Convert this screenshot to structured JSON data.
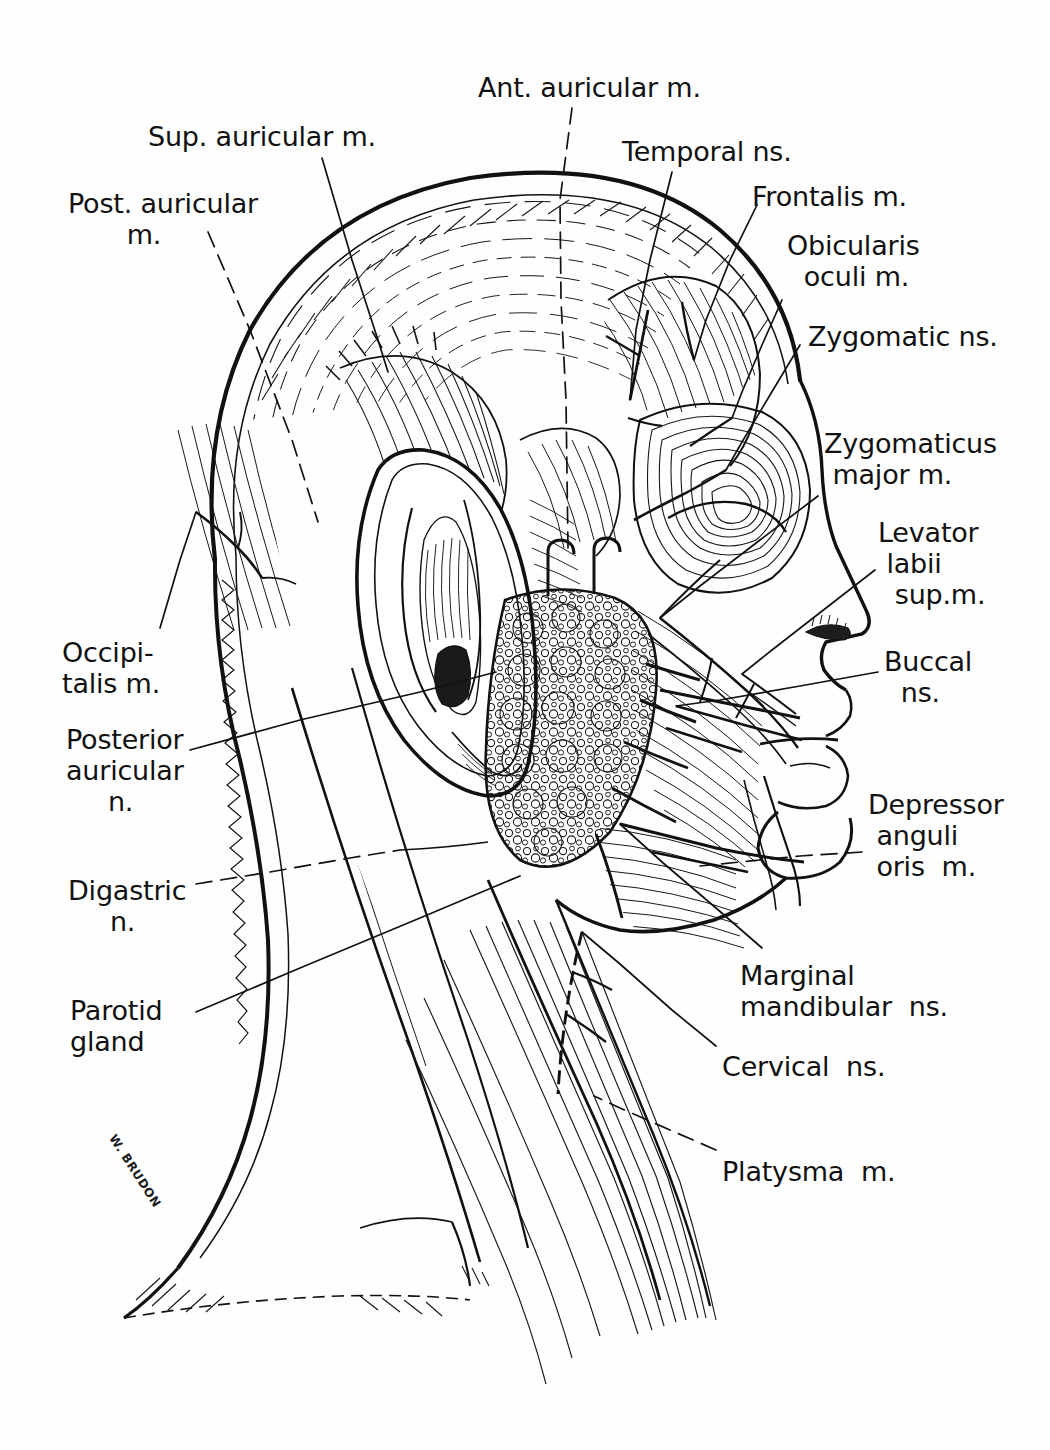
{
  "figure": {
    "artist_signature": "W. BRUDON",
    "ink_color": "#111111",
    "paper_color": "#fefefe"
  },
  "labels": [
    {
      "id": "ant-auricular-m",
      "text": "Ant. auricular m.",
      "x": 478,
      "y": 72,
      "align": "left"
    },
    {
      "id": "sup-auricular-m",
      "text": "Sup. auricular m.",
      "x": 148,
      "y": 121,
      "align": "left"
    },
    {
      "id": "temporal-ns",
      "text": "Temporal ns.",
      "x": 622,
      "y": 136,
      "align": "left"
    },
    {
      "id": "post-auricular-m",
      "text": "Post. auricular\n       m.",
      "x": 68,
      "y": 188,
      "align": "left"
    },
    {
      "id": "frontalis-m",
      "text": "Frontalis m.",
      "x": 752,
      "y": 181,
      "align": "left"
    },
    {
      "id": "obicularis-oculi-m",
      "text": "Obicularis\n  oculi m.",
      "x": 787,
      "y": 230,
      "align": "left"
    },
    {
      "id": "zygomatic-ns",
      "text": "Zygomatic ns.",
      "x": 808,
      "y": 321,
      "align": "left"
    },
    {
      "id": "zygomaticus-major-m",
      "text": "Zygomaticus\n major m.",
      "x": 824,
      "y": 428,
      "align": "left"
    },
    {
      "id": "levator-labii-sup-m",
      "text": "Levator\n labii\n  sup.m.",
      "x": 878,
      "y": 517,
      "align": "left"
    },
    {
      "id": "occipitalis-m",
      "text": "Occipi-\ntalis m.",
      "x": 62,
      "y": 637,
      "align": "left"
    },
    {
      "id": "buccal-ns",
      "text": "Buccal\n  ns.",
      "x": 884,
      "y": 646,
      "align": "left"
    },
    {
      "id": "posterior-auricular-n",
      "text": "Posterior\nauricular\n     n.",
      "x": 66,
      "y": 724,
      "align": "left"
    },
    {
      "id": "depressor-anguli-oris-m",
      "text": "Depressor\n anguli\n oris  m.",
      "x": 868,
      "y": 789,
      "align": "left"
    },
    {
      "id": "digastric-n",
      "text": "Digastric\n     n.",
      "x": 68,
      "y": 875,
      "align": "left"
    },
    {
      "id": "marginal-mandibular-ns",
      "text": "Marginal\nmandibular  ns.",
      "x": 740,
      "y": 960,
      "align": "left"
    },
    {
      "id": "parotid-gland",
      "text": "Parotid\ngland",
      "x": 70,
      "y": 995,
      "align": "left"
    },
    {
      "id": "cervical-ns",
      "text": "Cervical  ns.",
      "x": 722,
      "y": 1051,
      "align": "left"
    },
    {
      "id": "platysma-m",
      "text": "Platysma  m.",
      "x": 722,
      "y": 1156,
      "align": "left"
    }
  ],
  "leader_lines": [
    {
      "id": "leader-ant-auricular-m",
      "label": "ant-auricular-m",
      "dashed": true,
      "path": "M 572,108 L 560,200 L 561,300 L 566,400 L 568,548"
    },
    {
      "id": "leader-sup-auricular-m",
      "label": "sup-auricular-m",
      "dashed": false,
      "path": "M 322,158 L 352,260 L 378,340 L 388,372"
    },
    {
      "id": "leader-temporal-ns",
      "label": "temporal-ns",
      "dashed": false,
      "path": "M 672,172 L 650,260 L 636,330 L 630,400"
    },
    {
      "id": "leader-post-auricular-m",
      "label": "post-auricular-m",
      "dashed": true,
      "path": "M 208,232 L 250,330 L 292,440 L 318,522"
    },
    {
      "id": "leader-frontalis-m",
      "label": "frontalis-m",
      "dashed": false,
      "path": "M 757,205 L 730,260 L 706,320 L 694,360"
    },
    {
      "id": "leader-obicularis-oculi-m",
      "label": "obicularis-oculi-m",
      "dashed": false,
      "path": "M 782,300 L 762,345 L 742,392 L 732,418"
    },
    {
      "id": "leader-zygomatic-ns",
      "label": "zygomatic-ns",
      "dashed": false,
      "path": "M 800,345 L 770,395 L 742,442 L 726,470"
    },
    {
      "id": "leader-zygomaticus-major-m",
      "label": "zygomaticus-major-m",
      "dashed": false,
      "path": "M 818,496 L 760,540 L 700,586 L 660,618"
    },
    {
      "id": "leader-levator-labii-sup-m",
      "label": "levator-labii-sup-m",
      "dashed": false,
      "path": "M 875,570 L 826,608 L 772,650 L 742,674"
    },
    {
      "id": "leader-occipitalis-m",
      "label": "occipitalis-m",
      "dashed": false,
      "path": "M 160,628 L 180,560 L 196,512"
    },
    {
      "id": "leader-buccal-ns",
      "label": "buccal-ns",
      "dashed": false,
      "path": "M 878,672 L 800,686 L 720,700 L 676,706"
    },
    {
      "id": "leader-posterior-auricular-n",
      "label": "posterior-auricular-n",
      "dashed": false,
      "path": "M 190,750 L 300,720 L 420,692 L 496,672"
    },
    {
      "id": "leader-depressor-anguli-oris-m",
      "label": "depressor-anguli-oris-m",
      "dashed": true,
      "path": "M 862,852 L 800,856 L 740,862 L 700,866"
    },
    {
      "id": "leader-digastric-n",
      "label": "digastric-n",
      "dashed": true,
      "path": "M 196,884 L 270,872 L 350,858 L 400,850"
    },
    {
      "id": "leader-marginal-mandibular-ns",
      "label": "marginal-mandibular-ns",
      "dashed": false,
      "path": "M 762,948 L 716,908 L 662,862 L 620,824"
    },
    {
      "id": "leader-parotid-gland",
      "label": "parotid-gland",
      "dashed": false,
      "path": "M 196,1012 L 300,968 L 420,918 L 520,876"
    },
    {
      "id": "leader-cervical-ns",
      "label": "cervical-ns",
      "dashed": false,
      "path": "M 716,1046 L 672,1010 L 620,964 L 582,932"
    },
    {
      "id": "leader-platysma-m",
      "label": "platysma-m",
      "dashed": true,
      "path": "M 716,1150 L 670,1130 L 620,1108 L 594,1096"
    }
  ],
  "anatomy_regions": [
    {
      "id": "cranium-scalp",
      "name": "Scalp / cranial vault with galea aponeurotica"
    },
    {
      "id": "occipitalis-muscle",
      "name": "Occipitalis muscle"
    },
    {
      "id": "auricle",
      "name": "External ear (auricle)"
    },
    {
      "id": "parotid-gland-mass",
      "name": "Parotid gland (lobulated)"
    },
    {
      "id": "orbicularis-oculi",
      "name": "Orbicularis oculi muscle"
    },
    {
      "id": "frontalis-muscle",
      "name": "Frontalis muscle"
    },
    {
      "id": "zygomaticus-major",
      "name": "Zygomaticus major muscle"
    },
    {
      "id": "orbicularis-oris",
      "name": "Orbicularis oris / lips"
    },
    {
      "id": "masseter-region",
      "name": "Masseter / cheek region"
    },
    {
      "id": "sternocleidomastoid",
      "name": "Sternocleidomastoid muscle"
    },
    {
      "id": "platysma-muscle",
      "name": "Platysma muscle of the neck"
    },
    {
      "id": "facial-nerve-trunk",
      "name": "Facial nerve (CN VII) branching trunk"
    }
  ]
}
